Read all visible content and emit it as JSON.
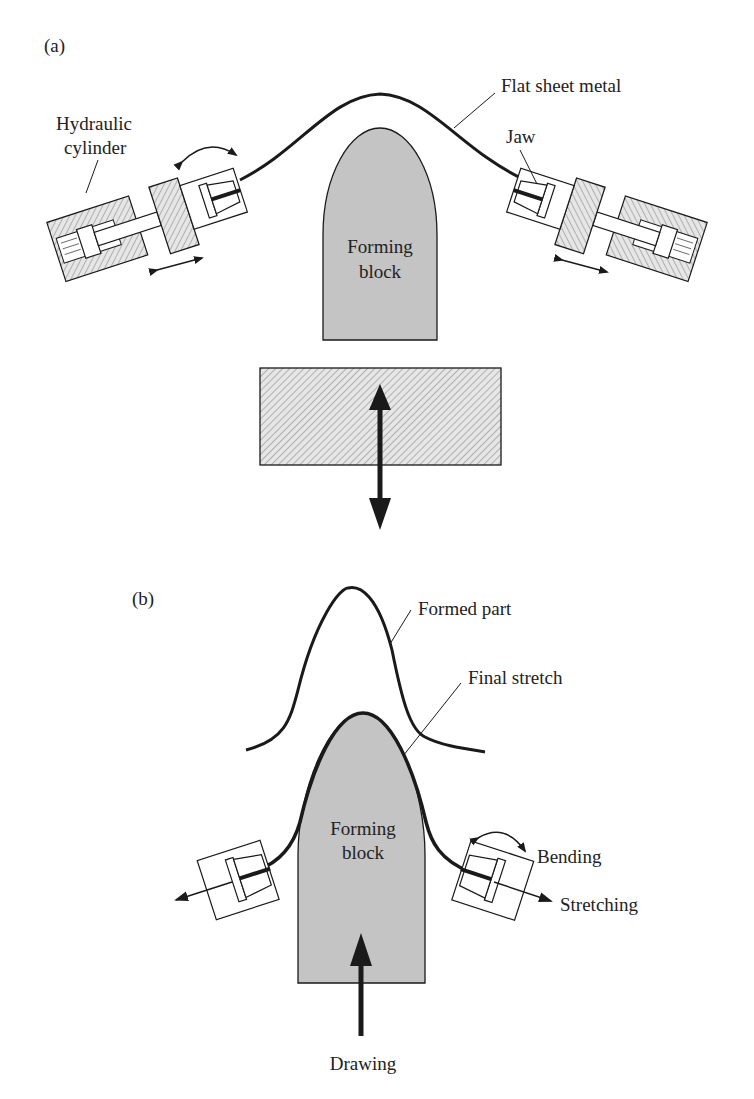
{
  "panel_a": {
    "tag": "(a)",
    "labels": {
      "hydraulic_cylinder_line1": "Hydraulic",
      "hydraulic_cylinder_line2": "cylinder",
      "flat_sheet_metal": "Flat sheet metal",
      "jaw": "Jaw",
      "forming_block_line1": "Forming",
      "forming_block_line2": "block"
    }
  },
  "panel_b": {
    "tag": "(b)",
    "labels": {
      "formed_part": "Formed part",
      "final_stretch": "Final stretch",
      "forming_block_line1": "Forming",
      "forming_block_line2": "block",
      "bending": "Bending",
      "stretching": "Stretching",
      "drawing": "Drawing"
    }
  },
  "colors": {
    "block_fill": "#c4c4c4",
    "stroke": "#1a1a1a",
    "hatch": "#8a8a8a"
  }
}
